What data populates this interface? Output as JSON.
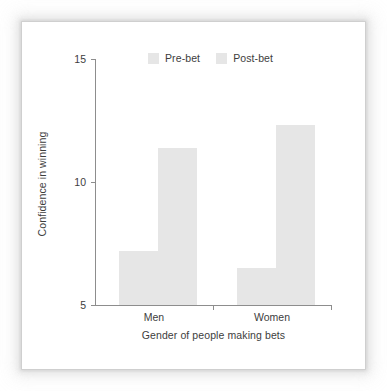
{
  "chart_data": {
    "type": "bar",
    "title": "",
    "subtitle": "",
    "xlabel": "Gender of people making bets",
    "ylabel": "Confidence in winning",
    "categories": [
      "Men",
      "Women"
    ],
    "series": [
      {
        "name": "Pre-bet",
        "values": [
          7.2,
          6.5
        ],
        "color": "#e6e6e6"
      },
      {
        "name": "Post-bet",
        "values": [
          11.4,
          12.3
        ],
        "color": "#e6e6e6"
      }
    ],
    "ylim": [
      5,
      15
    ],
    "yticks": [
      5,
      10,
      15
    ],
    "ytick_labels": [
      "5",
      "10",
      "15"
    ],
    "grid": false,
    "legend_position": "top-center",
    "axis_color": "#8d8d8d",
    "text_color": "#3d3d3d",
    "background_color": "#ffffff"
  },
  "legend": {
    "entries": [
      {
        "label": "Pre-bet"
      },
      {
        "label": "Post-bet"
      }
    ]
  },
  "axes": {
    "y_title": "Confidence in winning",
    "x_title": "Gender of people making bets",
    "y_ticks": [
      {
        "label": "15"
      },
      {
        "label": "10"
      },
      {
        "label": "5"
      }
    ],
    "x_categories": [
      {
        "label": "Men"
      },
      {
        "label": "Women"
      }
    ]
  }
}
